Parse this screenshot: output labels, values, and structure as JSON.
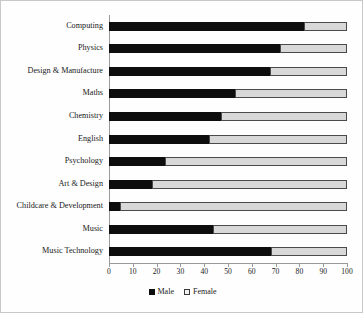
{
  "chart": {
    "title": "",
    "frame_border_color": "#c8c8c8",
    "axis_color": "#9a9a9a"
  },
  "legend": {
    "position": "bottom-center",
    "items": [
      {
        "label": "Male",
        "color": "#0d0d0d",
        "swatch": "filled-square-icon"
      },
      {
        "label": "Female",
        "color": "#d8d8d8",
        "swatch": "outlined-square-icon"
      }
    ]
  },
  "xaxis": {
    "label": "",
    "min": 0,
    "max": 100,
    "step": 10,
    "ticks": [
      "0",
      "10",
      "20",
      "30",
      "40",
      "50",
      "60",
      "70",
      "80",
      "90",
      "100"
    ]
  },
  "yaxis": {
    "label": ""
  },
  "chart_data": {
    "type": "bar",
    "orientation": "horizontal",
    "stacked": true,
    "title": "",
    "xlabel": "",
    "ylabel": "",
    "xlim": [
      0,
      100
    ],
    "grid": false,
    "legend_position": "bottom-center",
    "categories": [
      "Computing",
      "Physics",
      "Design & Manufacture",
      "Maths",
      "Chemistry",
      "English",
      "Psychology",
      "Art & Design",
      "Childcare & Development",
      "Music",
      "Music Technology"
    ],
    "series": [
      {
        "name": "Male",
        "color": "#0d0d0d",
        "values": [
          82,
          72,
          67.5,
          53,
          47,
          42,
          23.5,
          18,
          4.5,
          43.5,
          68
        ]
      },
      {
        "name": "Female",
        "color": "#d8d8d8",
        "values": [
          18,
          28,
          32.5,
          47,
          53,
          58,
          76.5,
          82,
          95.5,
          56.5,
          32
        ]
      }
    ]
  }
}
